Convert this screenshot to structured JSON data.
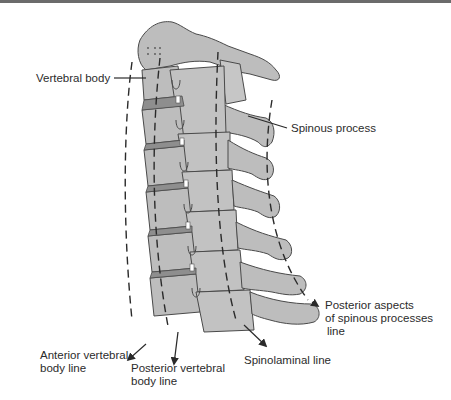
{
  "figure": {
    "type": "anatomical-diagram",
    "colors": {
      "bone_fill": "#bdbdbd",
      "bone_stroke": "#4a4a4a",
      "disc_fill": "#8a8a8a",
      "line_color": "#2a2a2a",
      "top_rule": "#6b6b6b"
    }
  },
  "labels": {
    "vertebral_body": "Vertebral body",
    "spinous_process": "Spinous process",
    "posterior_aspects": {
      "line1": "Posterior aspects",
      "line2": "of spinous processes",
      "line3": "line"
    },
    "anterior_vertebral": {
      "line1": "Anterior vertebral",
      "line2": "body line"
    },
    "posterior_vertebral": {
      "line1": "Posterior vertebral",
      "line2": "body line"
    },
    "spinolaminal": "Spinolaminal line"
  },
  "structures": [
    "Vertebral body",
    "Intervertebral disc",
    "Facet joint",
    "Lamina",
    "Spinous process"
  ],
  "alignment_lines": [
    "Anterior vertebral body line",
    "Posterior vertebral body line",
    "Spinolaminal line",
    "Posterior aspects of spinous processes line"
  ]
}
